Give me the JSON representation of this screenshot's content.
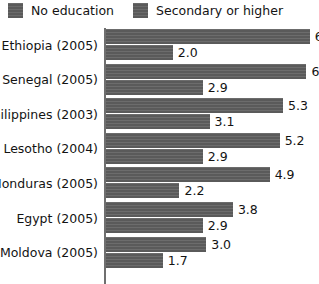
{
  "legend": {
    "items": [
      {
        "label": "No education",
        "swatch_name": "legend-swatch-no-education",
        "color": "#5a5a5a"
      },
      {
        "label": "Secondary or higher",
        "swatch_name": "legend-swatch-secondary-or-higher",
        "color": "#5a5a5a"
      }
    ]
  },
  "chart_data": {
    "type": "bar",
    "orientation": "horizontal",
    "title": "",
    "subtitle": "",
    "xlabel": "",
    "ylabel": "",
    "xlim": [
      0,
      6.3
    ],
    "grid": false,
    "legend_position": "top-left",
    "bar_color": "#5a5a5a",
    "categories": [
      "Ethiopia (2005)",
      "Senegal (2005)",
      "Philippines (2003)",
      "Lesotho (2004)",
      "Honduras (2005)",
      "Egypt (2005)",
      "Moldova (2005)"
    ],
    "series": [
      {
        "name": "No education",
        "values": [
          6.1,
          6.0,
          5.3,
          5.2,
          4.9,
          3.8,
          3.0
        ],
        "value_labels": [
          "6.",
          "6.0",
          "5.3",
          "5.2",
          "4.9",
          "3.8",
          "3.0"
        ]
      },
      {
        "name": "Secondary or higher",
        "values": [
          2.0,
          2.9,
          3.1,
          2.9,
          2.2,
          2.9,
          1.7
        ],
        "value_labels": [
          "2.0",
          "2.9",
          "3.1",
          "2.9",
          "2.2",
          "2.9",
          "1.7"
        ]
      }
    ]
  }
}
